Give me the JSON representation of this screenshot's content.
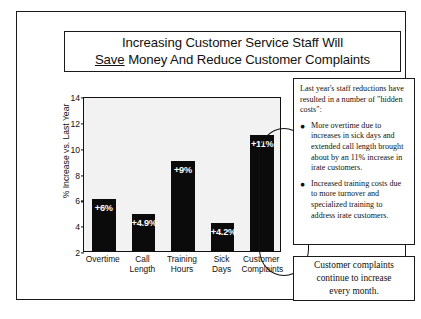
{
  "slide": {
    "title_line_1": "Increasing Customer Service Staff Will",
    "title_emphasis": "Save",
    "title_line_2_rest": " Money And Reduce Customer Complaints"
  },
  "chart_data": {
    "type": "bar",
    "title": "",
    "xlabel": "",
    "ylabel": "% Increase vs. Last Year",
    "categories": [
      "Overtime",
      "Call Length",
      "Training Hours",
      "Sick Days",
      "Customer Complaints"
    ],
    "category_lines": [
      [
        "Overtime"
      ],
      [
        "Call",
        "Length"
      ],
      [
        "Training",
        "Hours"
      ],
      [
        "Sick",
        "Days"
      ],
      [
        "Customer",
        "Complaints"
      ]
    ],
    "values": [
      6,
      4.9,
      9,
      4.2,
      11
    ],
    "data_labels": [
      "+6%",
      "+4.9%",
      "+9%",
      "+4.2%",
      "+11%"
    ],
    "ylim": [
      2,
      14
    ],
    "yticks": [
      2,
      4,
      6,
      8,
      10,
      12,
      14
    ],
    "ytick_labels": [
      "2",
      "4",
      "6",
      "8",
      "10",
      "12",
      "14"
    ],
    "grid": false,
    "legend": "none",
    "bar_color": "#0b0b0b",
    "plot_background": "#f2f2f2",
    "highlighted_category": "Customer Complaints",
    "annotation": "Oval highlight around Customer Complaints bar"
  },
  "notes": {
    "intro": "Last year's staff reductions have resulted in a number of \"hidden costs\":",
    "bullet_glyph": "●",
    "bullets": [
      "More overtime due to increases in sick days and extended call length brought about by an 11% increase in irate customers.",
      "Increased training costs due to more turnover and specialized training to address irate customers."
    ]
  },
  "conclusion": {
    "line_1": "Customer complaints",
    "line_2": "continue to increase",
    "line_3": "every month."
  }
}
